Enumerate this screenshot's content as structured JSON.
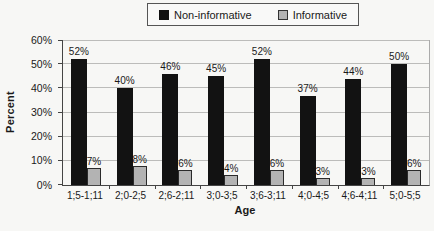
{
  "chart_data": {
    "type": "bar",
    "title": "",
    "xlabel": "Age",
    "ylabel": "Percent",
    "ylim": [
      0,
      60
    ],
    "y_tick_step": 10,
    "y_tick_suffix": "%",
    "data_label_suffix": "%",
    "grid": true,
    "legend_position": "top-center",
    "categories": [
      "1;5-1;11",
      "2;0-2;5",
      "2;6-2;11",
      "3;0-3;5",
      "3;6-3;11",
      "4;0-4;5",
      "4;6-4;11",
      "5;0-5;5"
    ],
    "series": [
      {
        "name": "Non-informative",
        "color": "#121212",
        "values": [
          52,
          40,
          46,
          45,
          52,
          37,
          44,
          50
        ]
      },
      {
        "name": "Informative",
        "color": "#b3b3b3",
        "values": [
          7,
          8,
          6,
          4,
          6,
          3,
          3,
          6
        ]
      }
    ]
  },
  "colors": {
    "background": "#f7f7f5",
    "gridline": "#bcbcba",
    "axis": "#444444",
    "text": "#1a1a1a"
  }
}
